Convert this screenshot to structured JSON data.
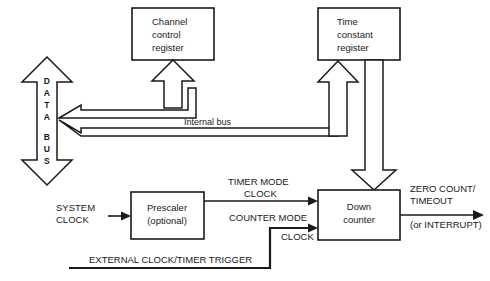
{
  "diagram": {
    "colors": {
      "line": "#1a1a1a",
      "background": "#ffffff",
      "fill": "#ffffff"
    },
    "blocks": {
      "channel_control_register": {
        "lines": [
          "Channel",
          "control",
          "register"
        ]
      },
      "time_constant_register": {
        "lines": [
          "Time",
          "constant",
          "register"
        ]
      },
      "prescaler": {
        "lines": [
          "Prescaler",
          "(optional)"
        ]
      },
      "down_counter": {
        "lines": [
          "Down",
          "counter"
        ]
      }
    },
    "buses": {
      "data_bus": {
        "letters": [
          "D",
          "A",
          "T",
          "A",
          "",
          "B",
          "U",
          "S"
        ],
        "label": "DATA BUS"
      },
      "internal_bus": {
        "label": "Internal bus"
      }
    },
    "signals": {
      "system_clock": {
        "lines": [
          "SYSTEM",
          "CLOCK"
        ]
      },
      "timer_mode_clock": {
        "lines": [
          "TIMER MODE",
          "CLOCK"
        ]
      },
      "counter_mode": {
        "lines": [
          "COUNTER MODE"
        ]
      },
      "clock": {
        "lines": [
          "CLOCK"
        ]
      },
      "external_clock_timer_trigger": {
        "lines": [
          "EXTERNAL CLOCK/TIMER TRIGGER"
        ]
      },
      "zero_count_timeout": {
        "lines": [
          "ZERO COUNT/",
          "TIMEOUT"
        ]
      },
      "or_interrupt": {
        "lines": [
          "(or INTERRUPT)"
        ]
      }
    }
  }
}
